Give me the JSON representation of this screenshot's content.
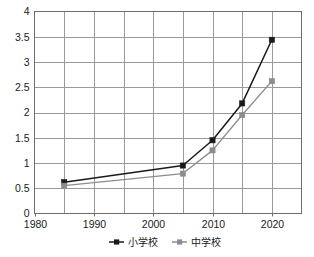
{
  "chart_data": {
    "type": "line",
    "title": "",
    "subtitle": "",
    "xlabel": "",
    "ylabel": "",
    "xlim": [
      1980,
      2025
    ],
    "ylim": [
      0,
      4
    ],
    "grid": true,
    "x_major_ticks": [
      1980,
      1990,
      2000,
      2010,
      2020
    ],
    "x_minor_gridlines": [
      1985,
      1995,
      2005,
      2015,
      2025
    ],
    "x_tick_labels": [
      "1980",
      "1990",
      "2000",
      "2010",
      "2020"
    ],
    "y_ticks": [
      0,
      0.5,
      1,
      1.5,
      2,
      2.5,
      3,
      3.5,
      4
    ],
    "y_tick_labels": [
      "0",
      "0.5",
      "1",
      "1.5",
      "2",
      "2.5",
      "3",
      "3.5",
      "4"
    ],
    "legend_position": "bottom",
    "x": [
      1985,
      2005,
      2010,
      2015,
      2020
    ],
    "series": [
      {
        "name": "小学校",
        "color": "#1a1a1a",
        "marker": "square",
        "values": [
          0.62,
          0.95,
          1.45,
          2.18,
          3.44
        ]
      },
      {
        "name": "中学校",
        "color": "#8c8c8c",
        "marker": "square",
        "values": [
          0.55,
          0.79,
          1.25,
          1.95,
          2.62
        ]
      }
    ]
  },
  "legend": {
    "items": [
      {
        "label": "小学校",
        "color": "#1a1a1a"
      },
      {
        "label": "中学校",
        "color": "#8c8c8c"
      }
    ]
  },
  "axes": {
    "y_labels": [
      "4",
      "3.5",
      "3",
      "2.5",
      "2",
      "1.5",
      "1",
      "0.5",
      "0"
    ],
    "x_labels": [
      "1980",
      "1990",
      "2000",
      "2010",
      "2020"
    ]
  },
  "colors": {
    "series_primary": "#1a1a1a",
    "series_secondary": "#8c8c8c",
    "grid": "#9a9a9a",
    "frame": "#6e6e6e",
    "background": "#ffffff"
  }
}
